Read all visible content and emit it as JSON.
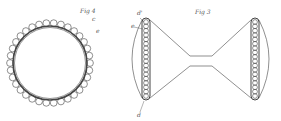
{
  "figures": [
    {
      "id": "fig4",
      "title": "Fig 4",
      "labels": [
        "c",
        "e"
      ],
      "beads": 34
    },
    {
      "id": "fig3",
      "title": "Fig 3",
      "labels": [
        "d'",
        "e",
        "d"
      ],
      "beads_per_side": 18
    }
  ],
  "colors": {
    "ink": "#444444",
    "background": "#ffffff"
  }
}
